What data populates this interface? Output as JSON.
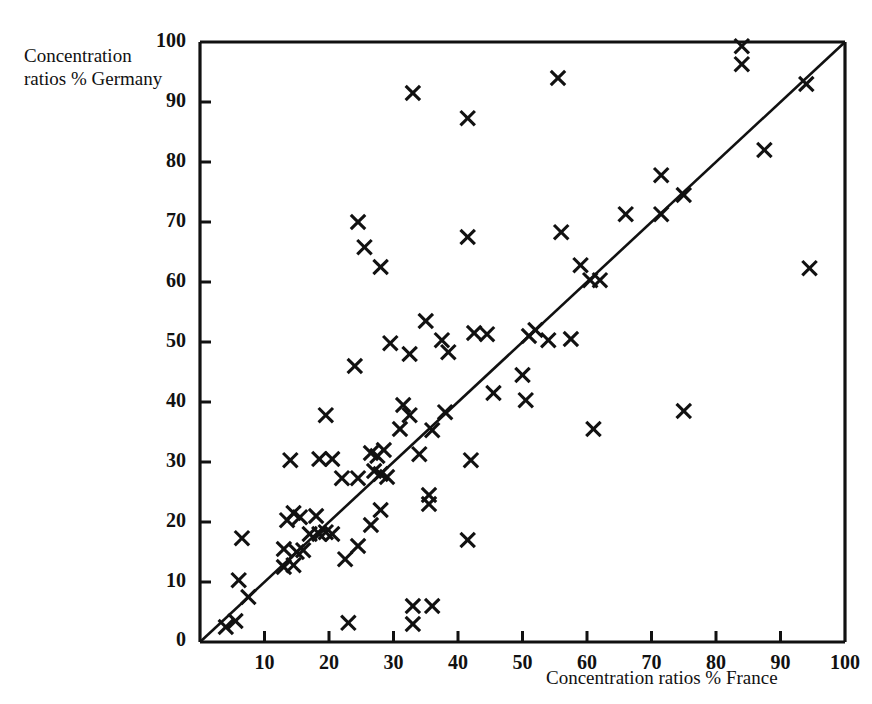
{
  "figure": {
    "background": "#ffffff",
    "ink_color": "#111111"
  },
  "labels": {
    "y_axis_title": "Concentration\nratios % Germany",
    "x_axis_title": "Concentration ratios % France"
  },
  "chart_data": {
    "type": "scatter",
    "title": "",
    "xlabel": "Concentration ratios % France",
    "ylabel": "Concentration ratios % Germany",
    "xlim": [
      0,
      100
    ],
    "ylim": [
      0,
      100
    ],
    "xticks": [
      10,
      20,
      30,
      40,
      50,
      60,
      70,
      80,
      90,
      100
    ],
    "yticks": [
      10,
      20,
      30,
      40,
      50,
      60,
      70,
      80,
      90,
      100
    ],
    "xtick_labels": [
      "10",
      "20",
      "30",
      "40",
      "50",
      "60",
      "70",
      "80",
      "90",
      "100"
    ],
    "ytick_labels": [
      "10",
      "20",
      "30",
      "40",
      "50",
      "60",
      "70",
      "80",
      "90",
      "100"
    ],
    "origin_label": "0",
    "grid": false,
    "legend": null,
    "marker": "x",
    "reference_line": {
      "label": "45-degree line",
      "from": [
        0,
        0
      ],
      "to": [
        100,
        100
      ]
    },
    "points": [
      [
        4.0,
        2.5
      ],
      [
        5.5,
        3.5
      ],
      [
        7.5,
        7.5
      ],
      [
        6.0,
        10.3
      ],
      [
        6.5,
        17.3
      ],
      [
        13.0,
        12.5
      ],
      [
        14.5,
        12.8
      ],
      [
        13.0,
        15.5
      ],
      [
        15.0,
        15.0
      ],
      [
        16.0,
        15.3
      ],
      [
        13.5,
        20.3
      ],
      [
        14.5,
        21.5
      ],
      [
        15.5,
        20.8
      ],
      [
        17.0,
        18.0
      ],
      [
        18.5,
        18.0
      ],
      [
        19.5,
        18.3
      ],
      [
        20.5,
        18.0
      ],
      [
        18.0,
        21.0
      ],
      [
        14.0,
        30.3
      ],
      [
        18.5,
        30.5
      ],
      [
        20.5,
        30.5
      ],
      [
        22.0,
        27.3
      ],
      [
        24.5,
        27.3
      ],
      [
        19.5,
        37.8
      ],
      [
        24.0,
        46.0
      ],
      [
        24.5,
        70.0
      ],
      [
        25.5,
        65.8
      ],
      [
        23.0,
        3.2
      ],
      [
        22.5,
        13.8
      ],
      [
        24.5,
        16.0
      ],
      [
        26.5,
        19.5
      ],
      [
        28.0,
        22.0
      ],
      [
        26.5,
        31.5
      ],
      [
        27.5,
        31.0
      ],
      [
        28.5,
        32.0
      ],
      [
        27.0,
        28.5
      ],
      [
        28.0,
        28.0
      ],
      [
        29.0,
        27.5
      ],
      [
        28.0,
        62.5
      ],
      [
        29.5,
        49.8
      ],
      [
        31.0,
        35.5
      ],
      [
        31.5,
        39.5
      ],
      [
        32.5,
        37.8
      ],
      [
        33.0,
        91.5
      ],
      [
        32.5,
        48.0
      ],
      [
        33.0,
        3.0
      ],
      [
        33.0,
        6.0
      ],
      [
        36.0,
        6.0
      ],
      [
        34.0,
        31.3
      ],
      [
        35.5,
        23.0
      ],
      [
        35.5,
        24.5
      ],
      [
        36.0,
        35.3
      ],
      [
        35.0,
        53.5
      ],
      [
        37.5,
        50.3
      ],
      [
        38.0,
        38.3
      ],
      [
        38.5,
        48.3
      ],
      [
        41.5,
        17.0
      ],
      [
        42.0,
        30.3
      ],
      [
        41.5,
        67.5
      ],
      [
        41.5,
        87.3
      ],
      [
        42.5,
        51.5
      ],
      [
        44.5,
        51.3
      ],
      [
        45.5,
        41.5
      ],
      [
        50.0,
        44.5
      ],
      [
        50.5,
        40.3
      ],
      [
        51.0,
        51.0
      ],
      [
        52.0,
        52.0
      ],
      [
        54.0,
        50.3
      ],
      [
        55.5,
        94.0
      ],
      [
        56.0,
        68.3
      ],
      [
        57.5,
        50.5
      ],
      [
        59.0,
        62.8
      ],
      [
        60.5,
        60.3
      ],
      [
        62.0,
        60.3
      ],
      [
        61.0,
        35.5
      ],
      [
        66.0,
        71.3
      ],
      [
        71.5,
        77.8
      ],
      [
        71.5,
        71.3
      ],
      [
        75.0,
        74.5
      ],
      [
        75.0,
        38.5
      ],
      [
        84.0,
        96.3
      ],
      [
        84.0,
        99.3
      ],
      [
        87.5,
        82.0
      ],
      [
        94.0,
        93.0
      ],
      [
        94.5,
        62.3
      ]
    ],
    "n_points": 85
  }
}
